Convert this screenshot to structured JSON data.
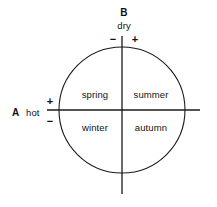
{
  "diagram": {
    "type": "quadrant-circle",
    "stroke_color": "#1a1a1a",
    "background_color": "#ffffff",
    "axes": {
      "horizontal": {
        "name": "A",
        "term": "hot",
        "positive_sign": "+",
        "negative_sign": "−"
      },
      "vertical": {
        "name": "B",
        "term": "dry",
        "negative_sign": "−",
        "positive_sign": "+"
      }
    },
    "quadrants": [
      {
        "key": "upper-left",
        "label": "spring"
      },
      {
        "key": "upper-right",
        "label": "summer"
      },
      {
        "key": "lower-left",
        "label": "winter"
      },
      {
        "key": "lower-right",
        "label": "autumn"
      }
    ]
  }
}
